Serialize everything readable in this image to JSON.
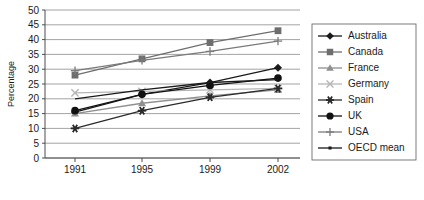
{
  "chart_data": {
    "type": "line",
    "title": "",
    "subtitle": "",
    "xlabel": "",
    "ylabel": "Percentage",
    "categories": [
      "1991",
      "1995",
      "1999",
      "2002"
    ],
    "x_tick_labels": [
      "1991",
      "1995",
      "1999",
      "2002"
    ],
    "y_tick_labels": [
      "0",
      "5",
      "10",
      "15",
      "20",
      "25",
      "30",
      "35",
      "40",
      "45",
      "50"
    ],
    "ylim": [
      0,
      50
    ],
    "y_tick_step": 5,
    "grid": true,
    "grid_axis": "y",
    "legend_position": "right",
    "series": [
      {
        "name": "Australia",
        "marker": "diamond",
        "color": "#1a1a1a",
        "values": [
          15.5,
          21.5,
          25.5,
          30.5
        ]
      },
      {
        "name": "Canada",
        "marker": "square",
        "color": "#6e6e6e",
        "values": [
          28.0,
          33.5,
          39.0,
          43.0
        ]
      },
      {
        "name": "France",
        "marker": "triangle",
        "color": "#8f8f8f",
        "values": [
          15.0,
          18.5,
          21.0,
          23.0
        ]
      },
      {
        "name": "Germany",
        "marker": "x",
        "color": "#b5b5b5",
        "values": [
          22.0,
          22.5,
          23.0,
          23.5
        ]
      },
      {
        "name": "Spain",
        "marker": "asterisk",
        "color": "#2b2b2b",
        "values": [
          10.0,
          16.0,
          20.5,
          23.5
        ]
      },
      {
        "name": "UK",
        "marker": "circle",
        "color": "#111111",
        "values": [
          16.0,
          21.5,
          24.5,
          27.0
        ]
      },
      {
        "name": "USA",
        "marker": "plus",
        "color": "#7a7a7a",
        "values": [
          29.5,
          33.0,
          36.0,
          39.5
        ]
      },
      {
        "name": "OECD mean",
        "marker": "line",
        "color": "#1a1a1a",
        "values": [
          20.0,
          23.0,
          25.5,
          26.5
        ]
      }
    ]
  },
  "legend": {
    "items": [
      {
        "label": "Australia"
      },
      {
        "label": "Canada"
      },
      {
        "label": "France"
      },
      {
        "label": "Germany"
      },
      {
        "label": "Spain"
      },
      {
        "label": "UK"
      },
      {
        "label": "USA"
      },
      {
        "label": "OECD mean"
      }
    ]
  },
  "axes": {
    "y_title": "Percentage"
  }
}
